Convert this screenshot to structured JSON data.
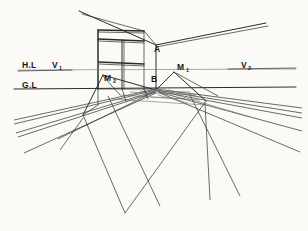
{
  "drawing": {
    "title": "Two-Point Perspective Room Construction",
    "medium": "pencil-on-paper",
    "background_color": "#fbfaf7",
    "ink_color": "#2b2b2b"
  },
  "labels": {
    "horizon_line": {
      "text": "H.L",
      "x": 22,
      "y": 68
    },
    "vanishing_point_left": {
      "text": "V",
      "sub": "1",
      "x": 52,
      "y": 68
    },
    "vanishing_point_right": {
      "text": "V",
      "sub": "2",
      "x": 241,
      "y": 68
    },
    "ground_line": {
      "text": "G.L",
      "x": 22,
      "y": 88
    },
    "corner_top": {
      "text": "A",
      "x": 154,
      "y": 52
    },
    "corner_bottom": {
      "text": "B",
      "x": 152,
      "y": 81
    },
    "measuring_point_right": {
      "text": "M",
      "sub": "1",
      "x": 178,
      "y": 70
    },
    "measuring_point_left": {
      "text": "M",
      "sub": "2",
      "x": 105,
      "y": 81
    }
  },
  "geometry": {
    "horizon_line_y": 70,
    "ground_line_y": 89,
    "corner_a": {
      "x": 156,
      "y": 45
    },
    "corner_b": {
      "x": 156,
      "y": 89
    },
    "vanishing_point_1": {
      "x": 58,
      "y": 70
    },
    "vanishing_point_2": {
      "x": 248,
      "y": 70
    },
    "measuring_point_1": {
      "x": 174,
      "y": 72
    },
    "measuring_point_2": {
      "x": 103,
      "y": 75
    },
    "convergence_apex": {
      "x": 125,
      "y": 213
    },
    "window": {
      "left": 98,
      "right": 144,
      "top": 30,
      "bottom": 89,
      "transom_y": 40,
      "mullion_x": 122,
      "sill_y": 62
    }
  },
  "caption": {
    "description": "Hand-drawn perspective construction showing a room corner with a window, the horizon line with vanishing points V1 and V2, the ground line, measuring points M1 and M2, and a radiating floor grid."
  }
}
